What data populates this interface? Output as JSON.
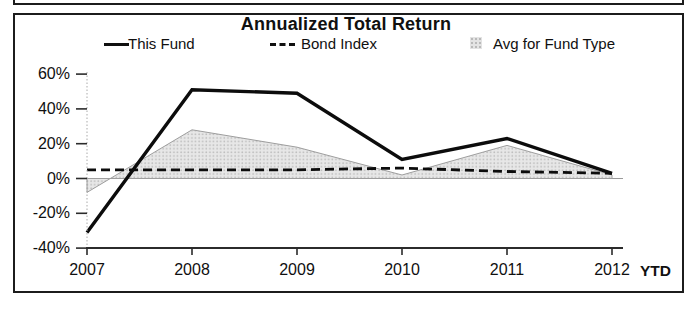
{
  "chart_data": {
    "type": "line",
    "title": "Annualized Total Return",
    "categories": [
      "2007",
      "2008",
      "2009",
      "2010",
      "2011",
      "2012"
    ],
    "x_axis_suffix": "YTD",
    "ylim": [
      -40,
      60
    ],
    "yticks": [
      60,
      40,
      20,
      0,
      -20,
      -40
    ],
    "ytick_labels": [
      "60%",
      "40%",
      "20%",
      "0%",
      "-20%",
      "-40%"
    ],
    "grid": "zero-line-only",
    "legend_position": "top",
    "series": [
      {
        "name": "This Fund",
        "type": "line",
        "style": "solid",
        "color": "#0c0c0c",
        "values": [
          -31,
          51,
          49,
          11,
          23,
          3
        ]
      },
      {
        "name": "Bond Index",
        "type": "line",
        "style": "dashed",
        "color": "#0c0c0c",
        "values": [
          5,
          5,
          5,
          6,
          4,
          3
        ]
      },
      {
        "name": "Avg for Fund Type",
        "type": "area",
        "style": "area",
        "color": "#e3e3e3",
        "values": [
          -8,
          28,
          18,
          2,
          19,
          2
        ]
      }
    ]
  }
}
